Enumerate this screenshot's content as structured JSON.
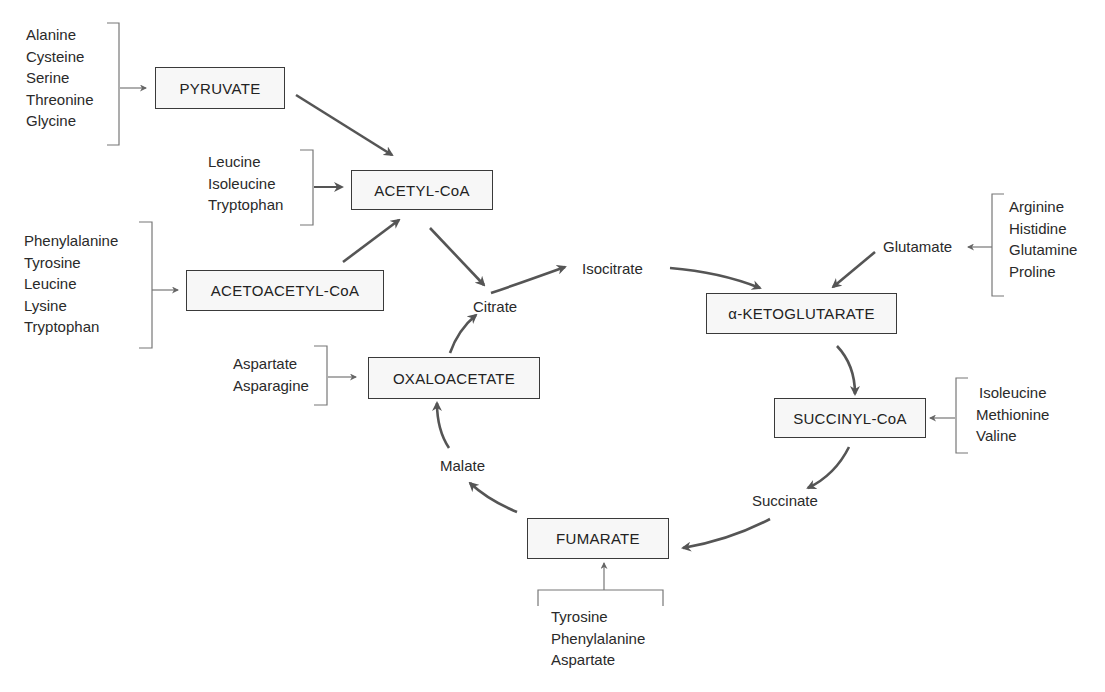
{
  "diagram": {
    "type": "metabolic-pathway"
  },
  "boxes": {
    "pyruvate": "PYRUVATE",
    "acetyl_coa": "ACETYL-CoA",
    "acetoacetyl_coa": "ACETOACETYL-CoA",
    "oxaloacetate": "OXALOACETATE",
    "alpha_ketoglutarate": "α-KETOGLUTARATE",
    "succinyl_coa": "SUCCINYL-CoA",
    "fumarate": "FUMARATE"
  },
  "intermediates": {
    "citrate": "Citrate",
    "isocitrate": "Isocitrate",
    "glutamate": "Glutamate",
    "succinate": "Succinate",
    "malate": "Malate"
  },
  "inputs": {
    "pyruvate": [
      "Alanine",
      "Cysteine",
      "Serine",
      "Threonine",
      "Glycine"
    ],
    "acetyl_coa": [
      "Leucine",
      "Isoleucine",
      "Tryptophan"
    ],
    "acetoacetyl_coa": [
      "Phenylalanine",
      "Tyrosine",
      "Leucine",
      "Lysine",
      "Tryptophan"
    ],
    "oxaloacetate": [
      "Aspartate",
      "Asparagine"
    ],
    "glutamate": [
      "Arginine",
      "Histidine",
      "Glutamine",
      "Proline"
    ],
    "succinyl_coa": [
      "Isoleucine",
      "Methionine",
      "Valine"
    ],
    "fumarate": [
      "Tyrosine",
      "Phenylalanine",
      "Aspartate"
    ]
  },
  "colors": {
    "arrow": "#555555",
    "box_border": "#3a3a3a",
    "box_fill": "#f7f7f7",
    "text": "#2a2a2a"
  }
}
